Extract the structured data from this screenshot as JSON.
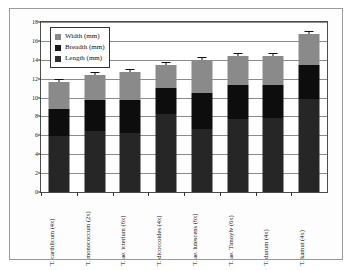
{
  "chart_data": {
    "type": "bar",
    "stacked": true,
    "title": "",
    "xlabel": "",
    "ylabel": "",
    "ylim": [
      0,
      18
    ],
    "ytick_step": 2,
    "yticks": [
      "0",
      "2",
      "4",
      "6",
      "8",
      "10",
      "12",
      "14",
      "16",
      "18"
    ],
    "grid": true,
    "legend_position": "top-left",
    "categories": [
      "T. carthlicum (4x)",
      "T. monococcum (2x)",
      "T. ae. icterium (6x)",
      "T. dicoccoides (4x)",
      "T. ae. lutescens (6x)",
      "T. ae. Timoylv (6x)",
      "T. durum (4x)",
      "T. kamut (4x)"
    ],
    "series": [
      {
        "name": "Length (mm)",
        "color": "#262626",
        "values": [
          5.9,
          6.5,
          6.3,
          8.3,
          6.7,
          7.7,
          7.8,
          9.9
        ]
      },
      {
        "name": "Breadth (mm)",
        "color": "#0d0d0d",
        "values": [
          2.9,
          3.2,
          3.4,
          2.7,
          3.8,
          3.6,
          3.5,
          3.6
        ]
      },
      {
        "name": "Width (mm)",
        "color": "#8a8a8a",
        "values": [
          2.8,
          2.7,
          3.0,
          2.4,
          3.5,
          3.15,
          3.15,
          3.2
        ]
      }
    ],
    "cumulative_tops": {
      "length": [
        5.9,
        6.5,
        6.3,
        8.3,
        6.7,
        7.7,
        7.8,
        9.9
      ],
      "breadth": [
        8.8,
        9.7,
        9.7,
        11.0,
        10.5,
        11.3,
        11.3,
        13.5
      ],
      "total": [
        11.6,
        12.4,
        12.7,
        13.4,
        14.0,
        14.45,
        14.45,
        16.7
      ]
    },
    "error_bars": true
  },
  "legend": {
    "entries": [
      {
        "label": "Width (mm)",
        "color": "#8a8a8a"
      },
      {
        "label": "Breadth (mm)",
        "color": "#1a1a1a"
      },
      {
        "label": "Length (mm)",
        "color": "#2e2e2e"
      }
    ]
  }
}
